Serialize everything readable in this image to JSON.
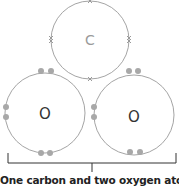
{
  "diagram": {
    "atoms": [
      {
        "symbol": "C",
        "name": "carbon",
        "cx": 90,
        "cy": 40,
        "r": 39,
        "label_color": "#9a9a9a"
      },
      {
        "symbol": "O",
        "name": "oxygen-left",
        "cx": 45,
        "cy": 113,
        "r": 40,
        "label_color": "#333333"
      },
      {
        "symbol": "O",
        "name": "oxygen-right",
        "cx": 134,
        "cy": 115,
        "r": 40,
        "label_color": "#333333"
      }
    ],
    "carbon_electron_marker": "×",
    "oxygen_electron_marker": "dot",
    "caption": "One carbon and two oxygen atoms",
    "colors": {
      "shell": "#9a9a9a",
      "electron": "#a8a8a8",
      "bracket": "#333333"
    }
  }
}
